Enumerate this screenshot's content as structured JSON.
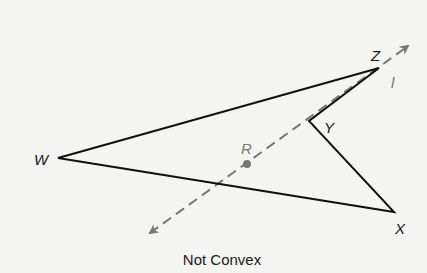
{
  "figure": {
    "caption": "Not Convex",
    "colors": {
      "polygon": "#111111",
      "line": "#777777",
      "background": "#f4f4f2",
      "label_black": "#1a1a1a",
      "label_gray": "#777777"
    },
    "polygon": {
      "name": "WZYX",
      "vertices": [
        {
          "label": "W",
          "x": 58,
          "y": 158
        },
        {
          "label": "Z",
          "x": 379,
          "y": 68
        },
        {
          "label": "Y",
          "x": 309,
          "y": 121
        },
        {
          "label": "X",
          "x": 394,
          "y": 212
        }
      ]
    },
    "line": {
      "label": "l",
      "style": "dashed",
      "arrows": "both",
      "from": {
        "x": 150,
        "y": 233
      },
      "to": {
        "x": 408,
        "y": 46
      }
    },
    "point": {
      "label": "R",
      "x": 247,
      "y": 164
    },
    "labels": {
      "W": "W",
      "Z": "Z",
      "Y": "Y",
      "X": "X",
      "R": "R",
      "l": "l"
    }
  }
}
